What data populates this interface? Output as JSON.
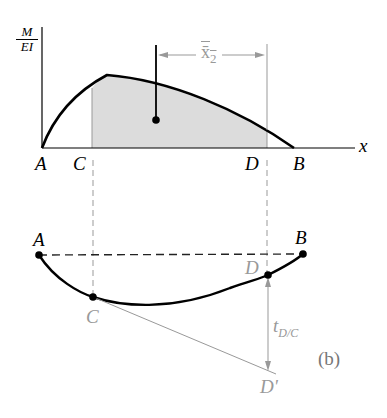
{
  "diagram": {
    "panel_label": "(b)",
    "moment_diagram": {
      "y_axis_label_top": "M",
      "y_axis_label_bottom": "EI",
      "x_axis_label": "x",
      "points": [
        "A",
        "C",
        "D",
        "B"
      ],
      "centroid_distance_label": "x̄",
      "centroid_distance_subscript": "2"
    },
    "elastic_curve": {
      "points": [
        "A",
        "B",
        "C",
        "D",
        "D'"
      ],
      "tangential_deviation_label": "t",
      "tangential_deviation_subscript": "D/C"
    },
    "colors": {
      "curve": "#000000",
      "shaded_area": "#d9d9d9",
      "gray_annotation": "#9a9a9a",
      "dashed": "#333333"
    }
  }
}
